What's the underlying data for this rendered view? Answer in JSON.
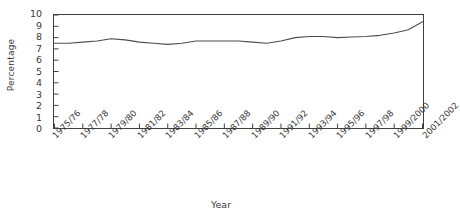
{
  "chart_data": {
    "type": "line",
    "title": "",
    "subtitle": "",
    "xlabel": "Year",
    "ylabel": "Percentage",
    "ylim": [
      0,
      10
    ],
    "yticks": [
      0,
      1,
      2,
      3,
      4,
      5,
      6,
      7,
      8,
      9,
      10
    ],
    "grid": false,
    "legend": null,
    "legend_position": "none",
    "annotations": [],
    "tick_labels_rotated": true,
    "tick_label_rotation_deg": -45,
    "xtick_label_every": 2,
    "categories": [
      "1975/76",
      "1976/77",
      "1977/78",
      "1978/79",
      "1979/80",
      "1980/81",
      "1981/82",
      "1982/83",
      "1983/84",
      "1984/85",
      "1985/86",
      "1986/87",
      "1987/88",
      "1988/89",
      "1989/90",
      "1990/91",
      "1991/92",
      "1992/93",
      "1993/94",
      "1994/95",
      "1995/96",
      "1996/97",
      "1997/98",
      "1998/99",
      "1999/2000",
      "2000/2001",
      "2001/2002"
    ],
    "xtick_labels": [
      "1975/76",
      "1977/78",
      "1979/80",
      "1981/82",
      "1983/84",
      "1985/86",
      "1987/88",
      "1989/90",
      "1991/92",
      "1993/94",
      "1995/96",
      "1997/98",
      "1999/2000",
      "2001/2002"
    ],
    "series": [
      {
        "name": "Percentage",
        "color": "#4d4d4d",
        "values": [
          7.5,
          7.5,
          7.6,
          7.7,
          7.9,
          7.8,
          7.6,
          7.5,
          7.4,
          7.5,
          7.7,
          7.7,
          7.7,
          7.7,
          7.6,
          7.5,
          7.7,
          8.0,
          8.1,
          8.1,
          8.0,
          8.05,
          8.1,
          8.2,
          8.4,
          8.7,
          9.4
        ]
      }
    ]
  }
}
